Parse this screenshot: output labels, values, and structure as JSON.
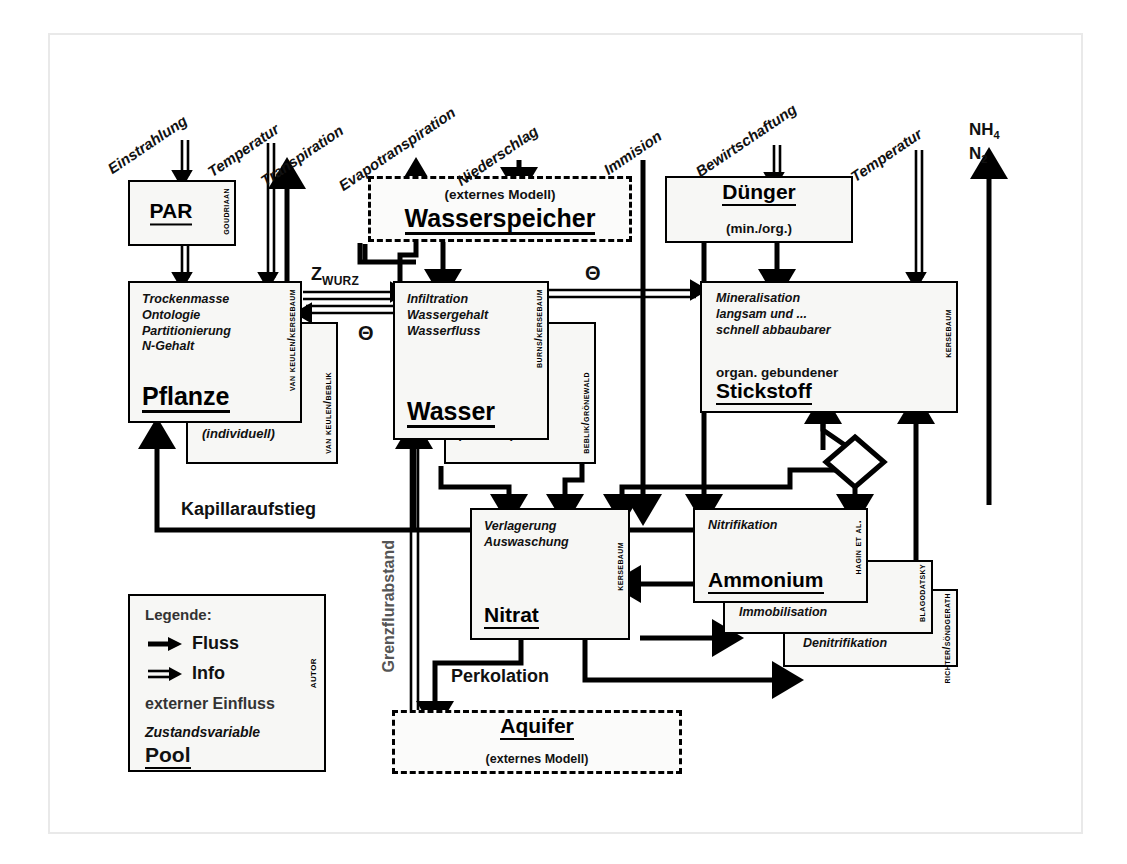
{
  "diagram": {
    "legend": {
      "heading": "Legende:",
      "items": [
        {
          "icon": "solid-arrow-icon",
          "label": "Fluss"
        },
        {
          "icon": "double-arrow-icon",
          "label": "Info"
        },
        {
          "icon": "none",
          "label": "externer Einfluss"
        },
        {
          "icon": "none",
          "label": "Zustandsvariable"
        },
        {
          "icon": "none",
          "label": "Pool"
        }
      ],
      "author_tag": "Autor"
    },
    "external_inputs": [
      {
        "label": "Einstrahlung",
        "arrow": "info"
      },
      {
        "label": "Temperatur",
        "arrow": "info"
      },
      {
        "label": "Transpiration",
        "arrow": "flux-out"
      },
      {
        "label": "Evapotranspiration",
        "arrow": "flux-out"
      },
      {
        "label": "Niederschlag",
        "arrow": "flux-in"
      },
      {
        "label": "Immision",
        "arrow": "flux-in"
      },
      {
        "label": "Bewirtschaftung",
        "arrow": "info"
      },
      {
        "label": "Temperatur",
        "arrow": "info"
      }
    ],
    "gas_output": {
      "line1": "NH",
      "sub1": "4",
      "line2": "N",
      "sub2": "2"
    },
    "nodes": {
      "par": {
        "pool": "PAR",
        "author": "Goudriaan"
      },
      "pflanze": {
        "vars": [
          "Trockenmasse",
          "Ontologie",
          "Partitionierung",
          "N-Gehalt"
        ],
        "pool": "Pflanze",
        "author": "van Keulen/Kersebaum",
        "back_author": "van Keulen/Beblik",
        "back_label": "(individuell)"
      },
      "wasserspeicher": {
        "note": "(externes Modell)",
        "pool": "Wasserspeicher"
      },
      "wasser": {
        "vars": [
          "Infiltration",
          "Wassergehalt",
          "Wasserfluss"
        ],
        "pool": "Wasser",
        "author": "Burns/Kersebaum",
        "back_author": "Beblik/Grönewald",
        "back_label": "(GPV-FK)/3"
      },
      "duenger": {
        "pool": "Dünger",
        "note": "(min./org.)"
      },
      "stickstoff": {
        "vars": [
          "Mineralisation",
          "langsam und ...",
          "schnell abbaubarer"
        ],
        "prefix": "organ. gebundener",
        "pool": "Stickstoff",
        "author": "Kersebaum"
      },
      "nitrat": {
        "vars": [
          "Verlagerung",
          "Auswaschung"
        ],
        "pool": "Nitrat",
        "author": "Kersebaum"
      },
      "ammonium": {
        "vars": [
          "Nitrifikation"
        ],
        "pool": "Ammonium",
        "author": "Hagin et al."
      },
      "immobilisation": {
        "label": "Immobilisation",
        "author": "Blagodatsky"
      },
      "denitrifikation": {
        "label": "Denitrifikation",
        "author": "Richter/Söndgerath"
      },
      "aquifer": {
        "pool": "Aquifer",
        "note": "(externes Modell)"
      }
    },
    "edge_labels": [
      {
        "name": "z-wurz",
        "text": "Z",
        "sub": "WURZ"
      },
      {
        "name": "theta-wasser-pflanze",
        "text": "Θ"
      },
      {
        "name": "theta-stickstoff",
        "text": "Θ"
      },
      {
        "name": "kapillaraufstieg",
        "text": "Kapillaraufstieg"
      },
      {
        "name": "perkolation",
        "text": "Perkolation"
      },
      {
        "name": "grenzflurabstand",
        "text": "Grenzflurabstand"
      }
    ]
  }
}
